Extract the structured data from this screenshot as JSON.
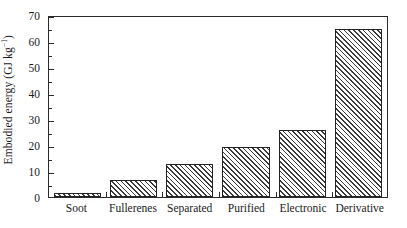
{
  "chart_data": {
    "type": "bar",
    "title": "",
    "subtitle": "",
    "xlabel": "",
    "ylabel": "Embodied energy (GJ kg",
    "ylabel_superscript": "−1",
    "ylabel_suffix": ")",
    "ylabel_full": "Embodied energy (GJ kg⁻¹)",
    "categories": [
      "Soot",
      "Fullerenes",
      "Separated",
      "Purified",
      "Electronic",
      "Derivative"
    ],
    "values": [
      1.7,
      6.6,
      12.7,
      19.2,
      25.7,
      64.5
    ],
    "ylim": [
      0,
      70
    ],
    "ytick_values": [
      0,
      10,
      20,
      30,
      40,
      50,
      60,
      70
    ],
    "ytick_labels": [
      "0",
      "10",
      "20",
      "30",
      "40",
      "50",
      "60",
      "70"
    ],
    "yminor_values": [
      5,
      15,
      25,
      35,
      45,
      55,
      65
    ],
    "grid": false,
    "legend": null,
    "legend_position": "none",
    "bar_fill": "diagonal-hatch",
    "bar_edge_color": "#232323",
    "bar_face_color": "#ffffff",
    "hatch_color": "#3a3a3a",
    "axis_color": "#2b2b2b",
    "background_color": "#ffffff",
    "annotations": []
  }
}
